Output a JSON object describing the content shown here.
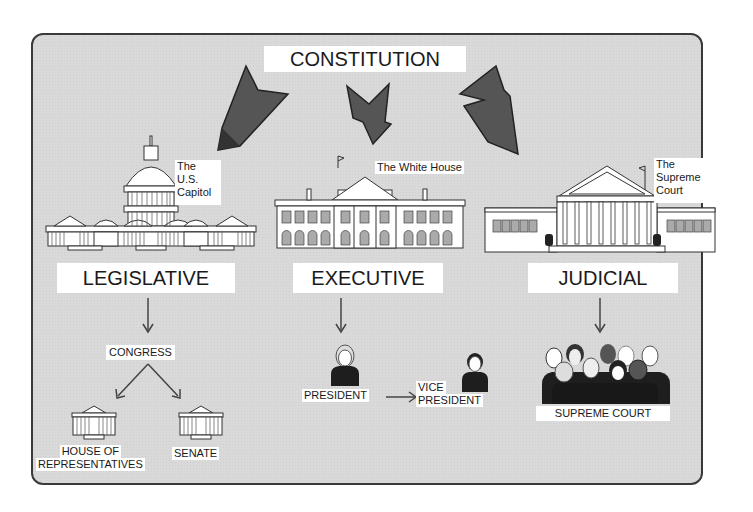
{
  "title": "CONSTITUTION",
  "branches": [
    {
      "name": "LEGISLATIVE",
      "building_label": "The U.S. Capitol",
      "building_label_lines": [
        "The",
        "U.S.",
        "Capitol"
      ]
    },
    {
      "name": "EXECUTIVE",
      "building_label": "The White House"
    },
    {
      "name": "JUDICIAL",
      "building_label": "The Supreme Court",
      "building_label_lines": [
        "The",
        "Supreme",
        "Court"
      ]
    }
  ],
  "legislative": {
    "body": "CONGRESS",
    "chambers": [
      {
        "label_lines": [
          "HOUSE OF",
          "REPRESENTATIVES"
        ]
      },
      {
        "label_lines": [
          "SENATE"
        ]
      }
    ]
  },
  "executive": {
    "president": "PRESIDENT",
    "vice_president_lines": [
      "VICE",
      "PRESIDENT"
    ]
  },
  "judicial": {
    "court": "SUPREME COURT"
  },
  "colors": {
    "panel_bg": "#d9d9d9",
    "arrow_fill": "#555555",
    "border": "#3a3a3a",
    "label_bg": "#ffffff"
  }
}
